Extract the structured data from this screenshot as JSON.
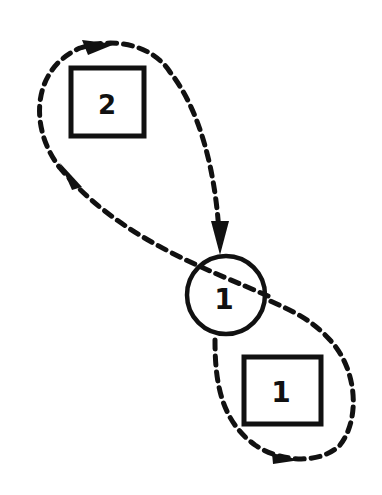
{
  "diagram": {
    "type": "state-transition",
    "colors": {
      "stroke": "#111111",
      "background": "#ffffff"
    },
    "nodes": [
      {
        "id": "square-2",
        "shape": "square",
        "label": "2"
      },
      {
        "id": "circle-1",
        "shape": "circle",
        "label": "1"
      },
      {
        "id": "square-1",
        "shape": "square",
        "label": "1"
      }
    ],
    "edges": [
      {
        "from": "circle-1",
        "to": "circle-1",
        "via": "square-2",
        "style": "dashed",
        "direction": "loop up-left around square 2, returning down into circle"
      },
      {
        "from": "circle-1",
        "to": "circle-1",
        "via": "square-1",
        "style": "dashed",
        "direction": "loop down-right around square 1"
      }
    ]
  }
}
